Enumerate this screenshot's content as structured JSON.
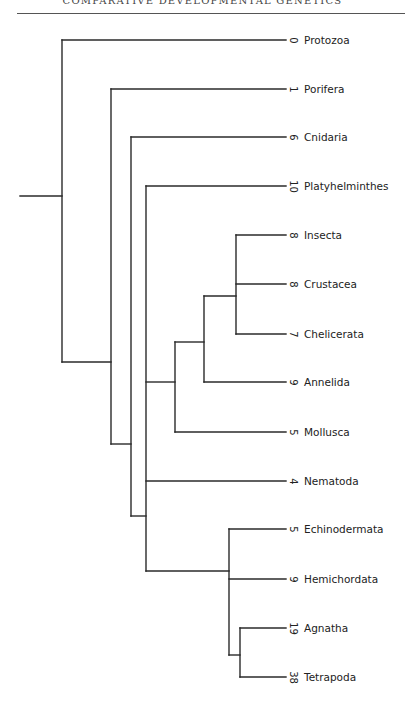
{
  "header": {
    "title": "COMPARATIVE DEVELOPMENTAL GENETICS"
  },
  "tree": {
    "line_color": "#2a2a2a",
    "leaves": [
      {
        "name": "Protozoa",
        "count": "0",
        "y": 40
      },
      {
        "name": "Porifera",
        "count": "1",
        "y": 89
      },
      {
        "name": "Cnidaria",
        "count": "6",
        "y": 137
      },
      {
        "name": "Platyhelminthes",
        "count": "10",
        "y": 186
      },
      {
        "name": "Insecta",
        "count": "8",
        "y": 235
      },
      {
        "name": "Crustacea",
        "count": "8",
        "y": 284
      },
      {
        "name": "Chelicerata",
        "count": "7",
        "y": 334
      },
      {
        "name": "Annelida",
        "count": "9",
        "y": 382
      },
      {
        "name": "Mollusca",
        "count": "5",
        "y": 432
      },
      {
        "name": "Nematoda",
        "count": "4",
        "y": 481
      },
      {
        "name": "Echinodermata",
        "count": "5",
        "y": 529
      },
      {
        "name": "Hemichordata",
        "count": "9",
        "y": 579
      },
      {
        "name": "Agnatha",
        "count": "19",
        "y": 628
      },
      {
        "name": "Tetrapoda",
        "count": "38",
        "y": 677
      }
    ]
  }
}
